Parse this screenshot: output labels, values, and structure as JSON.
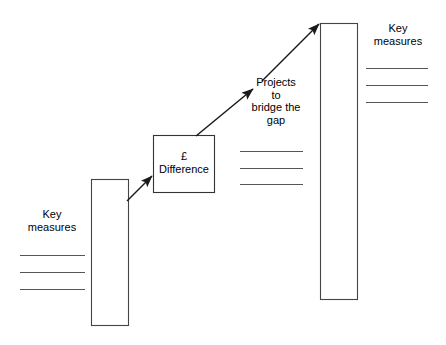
{
  "diagram": {
    "colors": {
      "stroke": "#333333",
      "text": "#000000",
      "background": "#ffffff",
      "rule": "#555555"
    },
    "labels": {
      "key_measures_left": "Key\nmeasures",
      "key_measures_right": "Key\nmeasures",
      "difference_box": "£\nDifference",
      "projects_bridge_gap": "Projects\nto\nbridge the\ngap"
    },
    "shapes": {
      "bar_left": {
        "x": 91,
        "y": 179,
        "width": 37,
        "height": 146
      },
      "bar_right": {
        "x": 320,
        "y": 23,
        "width": 37,
        "height": 276
      },
      "difference_box": {
        "x": 153,
        "y": 135,
        "width": 61,
        "height": 57
      }
    },
    "rule_groups": {
      "left": {
        "x1": 20,
        "x2": 85,
        "ys": [
          255,
          272,
          289
        ]
      },
      "middle": {
        "x1": 240,
        "x2": 303,
        "ys": [
          151,
          168,
          184
        ]
      },
      "right": {
        "x1": 366,
        "x2": 428,
        "ys": [
          68,
          85,
          102
        ]
      }
    },
    "arrows": {
      "bar_to_difference": {
        "x1": 127,
        "y1": 201,
        "x2": 152,
        "y2": 176
      },
      "difference_to_projects": {
        "x1": 196,
        "y1": 136,
        "x2": 253,
        "y2": 89
      },
      "projects_to_bar": {
        "x1": 262,
        "y1": 81,
        "x2": 319,
        "y2": 24
      }
    }
  }
}
